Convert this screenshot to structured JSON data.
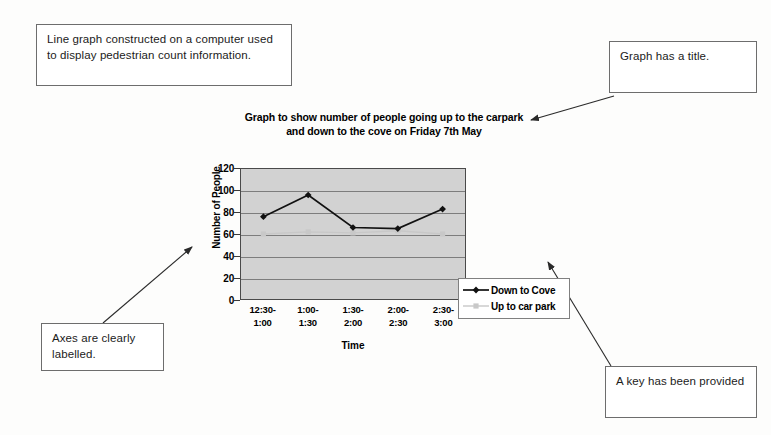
{
  "annotations": [
    {
      "id": "note-line-graph",
      "text": "Line graph constructed on a computer used to display pedestrian count information."
    },
    {
      "id": "note-title",
      "text": "Graph has a title."
    },
    {
      "id": "note-axes",
      "text": "Axes are clearly labelled."
    },
    {
      "id": "note-key",
      "text": "A key has been provided"
    }
  ],
  "chart_data": {
    "type": "line",
    "title": "Graph to show number of people going up to the carpark and down to the cove on Friday 7th May",
    "title_line1": "Graph to show number of people going up to the carpark",
    "title_line2": "and down to the cove on Friday 7th May",
    "xlabel": "Time",
    "ylabel": "Number of People",
    "categories": [
      "12:30-\n1:00",
      "1:00-\n1:30",
      "1:30-\n2:00",
      "2:00-\n2:30",
      "2:30-\n3:00"
    ],
    "ylim": [
      0,
      120
    ],
    "yticks": [
      0,
      20,
      40,
      60,
      80,
      100,
      120
    ],
    "grid": true,
    "legend_position": "right",
    "plot_background": "#d2d2d2",
    "series": [
      {
        "name": "Down to Cove",
        "color": "#111111",
        "marker": "diamond",
        "values": [
          76,
          96,
          66,
          65,
          83
        ]
      },
      {
        "name": "Up to car park",
        "color": "#c8c8c8",
        "marker": "square",
        "values": [
          60,
          62,
          61,
          63,
          60
        ]
      }
    ]
  }
}
